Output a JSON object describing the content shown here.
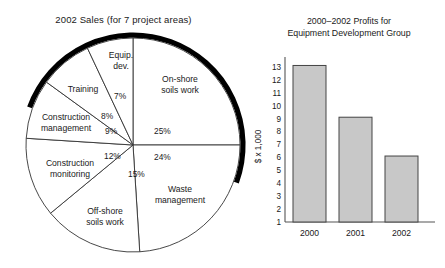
{
  "chart_data": [
    {
      "type": "pie",
      "title": "2002 Sales (for 7 project areas)",
      "legend_position": "none",
      "grid": false,
      "labels": [
        "On-shore soils work",
        "Waste management",
        "Off-shore soils work",
        "Construction monitoring",
        "Construction management",
        "Training",
        "Equip. dev."
      ],
      "values": [
        25,
        24,
        15,
        12,
        9,
        8,
        7
      ],
      "value_labels": [
        "25%",
        "24%",
        "15%",
        "12%",
        "9%",
        "8%",
        "7%"
      ],
      "units": "percent",
      "slices": [
        {
          "label": "On-shore soils work",
          "label_line_1": "On-shore",
          "label_line_2": "soils work",
          "value": 25,
          "value_label": "25%"
        },
        {
          "label": "Waste management",
          "label_line_1": "Waste",
          "label_line_2": "management",
          "value": 24,
          "value_label": "24%"
        },
        {
          "label": "Off-shore soils work",
          "label_line_1": "Off-shore",
          "label_line_2": "soils work",
          "value": 15,
          "value_label": "15%"
        },
        {
          "label": "Construction monitoring",
          "label_line_1": "Construction",
          "label_line_2": "monitoring",
          "value": 12,
          "value_label": "12%"
        },
        {
          "label": "Construction management",
          "label_line_1": "Construction",
          "label_line_2": "management",
          "value": 9,
          "value_label": "9%"
        },
        {
          "label": "Training",
          "label_line_1": "Training",
          "label_line_2": "",
          "value": 8,
          "value_label": "8%"
        },
        {
          "label": "Equip. dev.",
          "label_line_1": "Equip.",
          "label_line_2": "dev.",
          "value": 7,
          "value_label": "7%"
        }
      ],
      "colors": {
        "slice_fill": "#ffffff",
        "outline": "#333333",
        "shadow": "#000000"
      }
    },
    {
      "type": "bar",
      "title_line_1": "2000–2002 Profits for",
      "title_line_2": "Equipment Development Group",
      "title": "2000–2002 Profits for Equipment Development Group",
      "categories": [
        "2000",
        "2001",
        "2002"
      ],
      "values": [
        13.1,
        9.1,
        6.1
      ],
      "xlabel": "",
      "ylabel": "$ x 1,000",
      "ylim": [
        1,
        13.6
      ],
      "yticks": [
        1,
        2,
        3,
        4,
        5,
        6,
        7,
        8,
        9,
        10,
        11,
        12,
        13
      ],
      "ytick_labels": [
        "1",
        "2",
        "3",
        "4",
        "5",
        "6",
        "7",
        "8",
        "9",
        "10",
        "11",
        "12",
        "13"
      ],
      "grid": false,
      "legend_position": "none",
      "colors": {
        "bar_fill": "#c8c8c8",
        "bar_stroke": "#444444",
        "axis": "#555555"
      }
    }
  ]
}
